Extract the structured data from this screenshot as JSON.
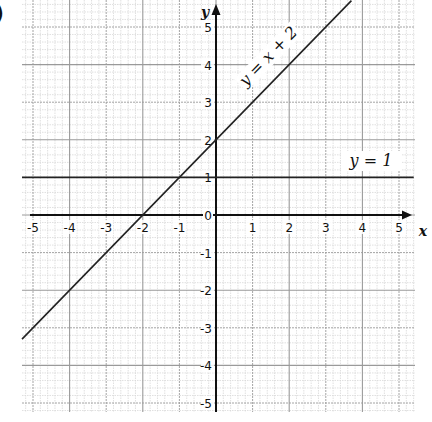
{
  "figure": {
    "part_marker": ")",
    "x_axis_label": "x",
    "y_axis_label": "y",
    "origin_label": "0"
  },
  "chart_data": {
    "type": "line",
    "title": "",
    "xlabel": "x",
    "ylabel": "y",
    "xlim": [
      -5.3,
      5.4
    ],
    "ylim": [
      -5.3,
      5.7
    ],
    "grid": true,
    "x_ticks": [
      -5,
      -4,
      -3,
      -2,
      -1,
      0,
      1,
      2,
      3,
      4,
      5
    ],
    "y_ticks": [
      -5,
      -4,
      -3,
      -2,
      -1,
      0,
      1,
      2,
      3,
      4,
      5
    ],
    "x_tick_labels": [
      "-5",
      "-4",
      "-3",
      "-2",
      "-1",
      "1",
      "2",
      "3",
      "4",
      "5"
    ],
    "y_tick_labels": [
      "5",
      "4",
      "3",
      "2",
      "1",
      "-1",
      "-2",
      "-3",
      "-4",
      "-5"
    ],
    "series": [
      {
        "name": "y = x + 2",
        "equation": "y = x + 2",
        "x": [
          -5.3,
          3.7
        ],
        "y": [
          -3.3,
          5.7
        ]
      },
      {
        "name": "y = 1",
        "equation": "y = 1",
        "x": [
          -5.3,
          5.4
        ],
        "y": [
          1,
          1
        ]
      }
    ],
    "annotations": [
      {
        "text": "y = x + 2",
        "near_x": 1.5,
        "near_y": 4.2
      },
      {
        "text": "y = 1",
        "near_x": 4.2,
        "near_y": 1.4
      }
    ]
  },
  "colors": {
    "line": "#222222",
    "axis": "#111111",
    "major_grid": "#9a9a9a",
    "minor_grid": "#d8d8d8",
    "background": "#ffffff"
  }
}
